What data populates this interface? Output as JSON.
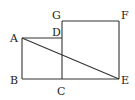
{
  "diagram": {
    "type": "geometry",
    "points": {
      "A": {
        "label": "A",
        "x": 22,
        "y": 38
      },
      "B": {
        "label": "B",
        "x": 22,
        "y": 79
      },
      "C": {
        "label": "C",
        "x": 62,
        "y": 79
      },
      "D": {
        "label": "D",
        "x": 62,
        "y": 38
      },
      "E": {
        "label": "E",
        "x": 119,
        "y": 79
      },
      "F": {
        "label": "F",
        "x": 119,
        "y": 21
      },
      "G": {
        "label": "G",
        "x": 62,
        "y": 21
      }
    },
    "segments": [
      "AB",
      "BC",
      "CD",
      "DA",
      "CE",
      "EF",
      "FG",
      "GC",
      "AE"
    ],
    "colors": {
      "line": "#333333",
      "label": "#222222",
      "background": "#ffffff"
    }
  }
}
